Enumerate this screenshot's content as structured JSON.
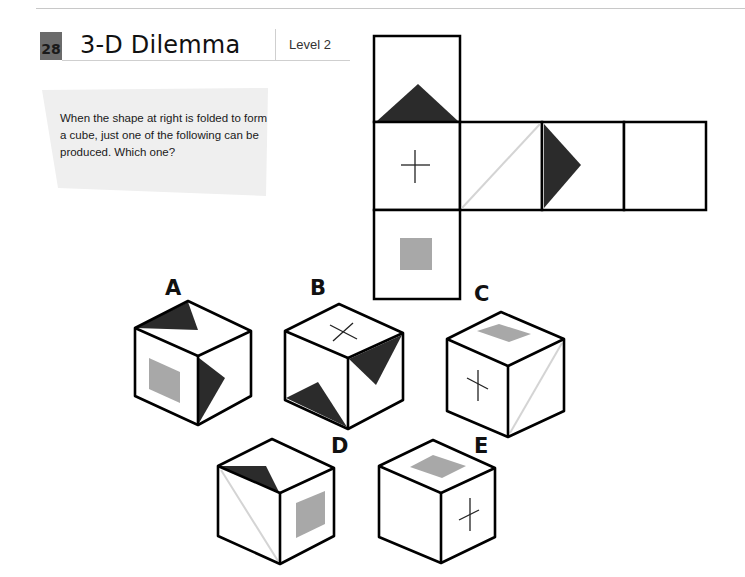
{
  "header": {
    "puzzle_number": "28",
    "title": "3-D Dilemma",
    "level": "Level 2"
  },
  "question": {
    "text": "When the shape at right is folded to form a cube, just one of the following can be produced. Which one?"
  },
  "colors": {
    "dark_fill": "#2b2b2b",
    "gray_fill": "#a8a8a8",
    "diag_line": "#d4d4d4",
    "stroke": "#000000",
    "question_bg": "#efefef",
    "number_badge": "#6b6b6b"
  },
  "net": {
    "faces": [
      {
        "id": "top",
        "symbol": "dark-triangle-bottom"
      },
      {
        "id": "middle-left",
        "symbol": "plus"
      },
      {
        "id": "middle-2",
        "symbol": "light-diagonal"
      },
      {
        "id": "middle-3",
        "symbol": "dark-triangle-left"
      },
      {
        "id": "middle-4",
        "symbol": "blank"
      },
      {
        "id": "bottom",
        "symbol": "gray-square"
      }
    ]
  },
  "options": [
    {
      "label": "A",
      "top": "dark-triangle",
      "left": "gray-square",
      "right": "dark-triangle"
    },
    {
      "label": "B",
      "top": "cross",
      "left": "dark-triangle",
      "right": "dark-triangle"
    },
    {
      "label": "C",
      "top": "gray-square",
      "left": "plus",
      "right": "light-diagonal"
    },
    {
      "label": "D",
      "top": "dark-triangle",
      "left": "light-diagonal",
      "right": "gray-square"
    },
    {
      "label": "E",
      "top": "gray-square",
      "left": "blank",
      "right": "plus"
    }
  ]
}
